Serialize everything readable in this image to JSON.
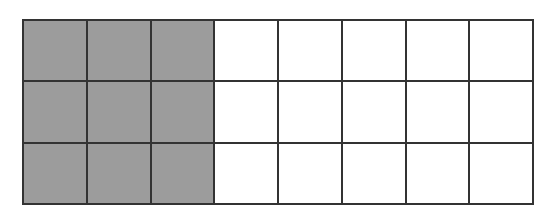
{
  "diagram": {
    "type": "fraction-grid",
    "rows": 3,
    "columns": 8,
    "shaded_columns": 3,
    "total_cells": 24,
    "shaded_cells": 9,
    "colors": {
      "shaded": "#9c9c9c",
      "unshaded": "#ffffff",
      "line": "#333333"
    }
  }
}
